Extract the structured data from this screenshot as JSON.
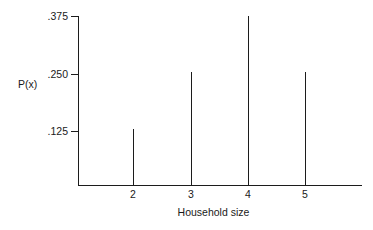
{
  "chart_data": {
    "type": "line",
    "subtype": "probability-spike-plot",
    "title": "",
    "xlabel": "Household size",
    "ylabel": "P(x)",
    "categories": [
      2,
      3,
      4,
      5
    ],
    "values": [
      0.125,
      0.25,
      0.375,
      0.25
    ],
    "x": [
      2,
      3,
      4,
      5
    ],
    "y": [
      0.125,
      0.25,
      0.375,
      0.25
    ],
    "point_labels": [
      "2",
      "3",
      "4",
      "5"
    ],
    "value_labels": [
      ".125",
      ".250",
      ".375",
      ".250"
    ],
    "xlim": [
      1.03,
      5.96
    ],
    "ylim": [
      0,
      0.4021
    ],
    "xticks": [
      2,
      3,
      4,
      5
    ],
    "xtick_labels": [
      "2",
      "3",
      "4",
      "5"
    ],
    "yticks": [
      0.125,
      0.25,
      0.375
    ],
    "ytick_labels": [
      ".125",
      ".250",
      ".375"
    ],
    "grid": false,
    "legend": false,
    "legend_position": "none",
    "series": [
      {
        "name": "P(x)",
        "values": [
          0.125,
          0.25,
          0.375,
          0.25
        ]
      }
    ],
    "colors": {
      "line": "#1c1c1c",
      "axis": "#1c1c1c",
      "text": "#1a1a1a",
      "background": "#ffffff"
    }
  },
  "axes": {
    "y_title": "P(x)",
    "x_title": "Household size",
    "y_ticks": [
      {
        "label": ".375",
        "value": 0.375
      },
      {
        "label": ".250",
        "value": 0.25
      },
      {
        "label": ".125",
        "value": 0.125
      }
    ],
    "x_ticks": [
      {
        "label": "2",
        "value": 2
      },
      {
        "label": "3",
        "value": 3
      },
      {
        "label": "4",
        "value": 4
      },
      {
        "label": "5",
        "value": 5
      }
    ]
  }
}
